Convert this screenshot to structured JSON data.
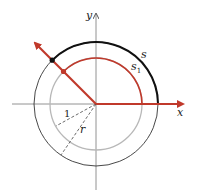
{
  "diagram": {
    "labels": {
      "x_axis": "x",
      "y_axis": "y",
      "outer_arc": "s",
      "inner_arc": "s",
      "inner_arc_subscript": "1",
      "unit_radius": "1",
      "outer_radius": "r"
    },
    "colors": {
      "accent": "#c0392b",
      "outer_circle": "#222222",
      "inner_circle": "#b5b5b5",
      "axes": "#555555"
    }
  }
}
